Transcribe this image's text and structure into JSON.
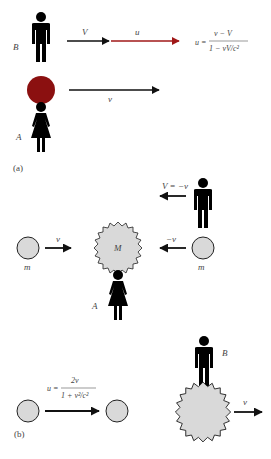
{
  "panel_a": {
    "caption": "(a)",
    "observer_b_label": "B",
    "observer_a_label": "A",
    "arrow_V_label": "V",
    "arrow_u_label": "u",
    "arrow_v_label": "v",
    "formula": {
      "lhs": "u =",
      "numerator": "v − V",
      "denominator": "1 − vV/c²"
    },
    "colors": {
      "ball": "#8b1010",
      "arrow_u": "#a01818",
      "arrow": "#111111"
    }
  },
  "panel_b": {
    "caption": "(b)",
    "top": {
      "observer_velocity_label": "V = −v",
      "left_mass_label": "m",
      "right_mass_label": "m",
      "center_mass_label": "M",
      "left_arrow_label": "v",
      "right_arrow_label": "−v",
      "observer_a_label": "A"
    },
    "bottom": {
      "formula": {
        "lhs": "u =",
        "numerator": "2v",
        "denominator": "1 + v²/c²"
      },
      "observer_b_label": "B",
      "arrow_label": "v"
    },
    "colors": {
      "circle_fill": "#d9d9d9",
      "outline": "#222222"
    }
  }
}
